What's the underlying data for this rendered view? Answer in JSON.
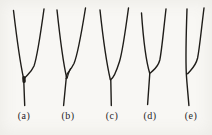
{
  "figure": {
    "colors": {
      "ink": "#1f1d19",
      "paper": "#f8f7f4"
    },
    "diagrams": [
      {
        "label": "(a)",
        "paths": {
          "left": "M13.5,10.5 C16.5,36 19.5,60 23.5,78",
          "right": "M44,9 C40,38 37.5,56 34,66 C31,73 26.5,75 24,79",
          "stem": "M23.7,79 L24.7,105.5",
          "knot": "M23.9,77.8 L24.1,81.4"
        }
      },
      {
        "label": "(b)",
        "paths": {
          "left": "M57,10 C60,38 63,62 66.5,77",
          "right": "M85.5,8 C81,36 78,54 74,63.5 C71,69.5 68.5,71.5 67.2,74 C66.6,75.4 66.3,76.8 66.2,78.5",
          "lens": "M70.5,68.5 C68.8,72.5 67.7,75.2 67.3,78.2",
          "stem": "M66.2,78.5 L63.6,105.5"
        }
      },
      {
        "label": "(c)",
        "paths": {
          "left": "M100,10 C103,38 106.5,63 110.3,79.5",
          "right": "M128.5,8 C125,34 122.5,52 119.5,61.5 C117,69.5 114.5,77.5 110.6,79.8",
          "stem": "M110.8,80.3 L111.3,105.5"
        }
      },
      {
        "label": "(d)",
        "paths": {
          "left": "M141.5,13 C143.5,42 146,61 149.7,73.2",
          "right": "M166,9 C163,35 161.8,50 159.8,60 C158,67.5 153.5,69.8 150.6,72.8",
          "stem": "M149.8,73.3 L147.6,104.5"
        }
      },
      {
        "label": "(e)",
        "paths": {
          "left": "M187,9 C186,38 185.6,58 186.3,73.5 C187.1,86 188.2,96 188.9,105.5",
          "right": "M204,8 C201,32 199.6,48 197.6,58 C195.6,66.5 191.2,69.5 187.6,73.8"
        }
      }
    ]
  }
}
